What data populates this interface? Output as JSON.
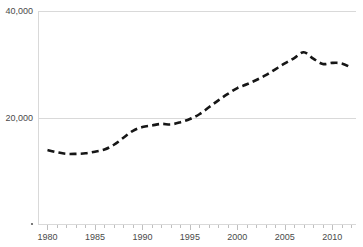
{
  "chart_data": {
    "type": "line",
    "title": "",
    "subtitle": "",
    "xlabel": "",
    "ylabel": "",
    "legend": [],
    "legend_position": "none",
    "grid": true,
    "gridlines_y": [
      20000,
      40000
    ],
    "xlim": [
      1979,
      2012.5
    ],
    "ylim": [
      0,
      40000
    ],
    "y_tick_labels": [
      "20,000",
      "40,000"
    ],
    "y_tick_values": [
      20000,
      40000
    ],
    "x_tick_labels": [
      "1980",
      "1985",
      "1990",
      "1995",
      "2000",
      "2005",
      "2010"
    ],
    "x_tick_values": [
      1980,
      1985,
      1990,
      1995,
      2000,
      2005,
      2010
    ],
    "x_minor_tick_step": 1,
    "line_style": "dashed",
    "line_color": "#161616",
    "grid_color": "#d9d9d9",
    "tick_label_color": "#4a4a4a",
    "x": [
      1980,
      1981,
      1982,
      1983,
      1984,
      1985,
      1986,
      1987,
      1988,
      1989,
      1990,
      1991,
      1992,
      1993,
      1994,
      1995,
      1996,
      1997,
      1998,
      1999,
      2000,
      2001,
      2002,
      2003,
      2004,
      2005,
      2006,
      2007,
      2008,
      2009,
      2010,
      2011,
      2012
    ],
    "values": [
      14000,
      13600,
      13300,
      13300,
      13400,
      13700,
      14100,
      15000,
      16300,
      17600,
      18300,
      18600,
      18900,
      18800,
      19200,
      19800,
      20700,
      22000,
      23300,
      24500,
      25600,
      26300,
      27100,
      28000,
      29100,
      30200,
      31200,
      32300,
      31100,
      30100,
      30300,
      30200,
      29400
    ],
    "series": [
      {
        "name": "series-1",
        "values": [
          14000,
          13600,
          13300,
          13300,
          13400,
          13700,
          14100,
          15000,
          16300,
          17600,
          18300,
          18600,
          18900,
          18800,
          19200,
          19800,
          20700,
          22000,
          23300,
          24500,
          25600,
          26300,
          27100,
          28000,
          29100,
          30200,
          31200,
          32300,
          31100,
          30100,
          30300,
          30200,
          29400
        ]
      }
    ],
    "annotations": []
  },
  "plot": {
    "left_px": 38,
    "right_px": 356,
    "top_px": 11,
    "bottom_px": 225
  }
}
